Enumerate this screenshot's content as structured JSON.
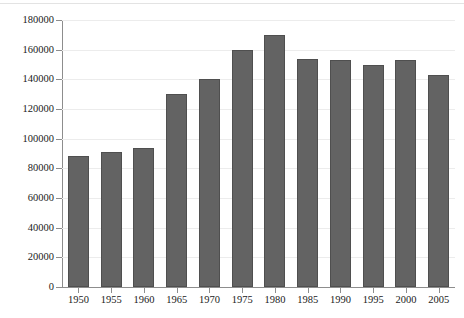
{
  "chart_data": {
    "type": "bar",
    "title": "",
    "subtitle": "",
    "xlabel": "",
    "ylabel": "",
    "categories": [
      "1950",
      "1955",
      "1960",
      "1965",
      "1970",
      "1975",
      "1980",
      "1985",
      "1990",
      "1995",
      "2000",
      "2005"
    ],
    "values": [
      88000,
      91000,
      94000,
      130000,
      140000,
      160000,
      170000,
      154000,
      153000,
      150000,
      153000,
      143000
    ],
    "series": [
      {
        "name": "",
        "values": [
          88000,
          91000,
          94000,
          130000,
          140000,
          160000,
          170000,
          154000,
          153000,
          150000,
          153000,
          143000
        ]
      }
    ],
    "ylim": [
      0,
      180000
    ],
    "ytick_labels": [
      "0",
      "20000",
      "40000",
      "60000",
      "80000",
      "100000",
      "120000",
      "140000",
      "160000",
      "180000"
    ],
    "ytick_values": [
      0,
      20000,
      40000,
      60000,
      80000,
      100000,
      120000,
      140000,
      160000,
      180000
    ],
    "xtick_labels": [
      "1950",
      "1955",
      "1960",
      "1965",
      "1970",
      "1975",
      "1980",
      "1985",
      "1990",
      "1995",
      "2000",
      "2005"
    ],
    "grid": true,
    "grid_axis": "y",
    "legend": false,
    "legend_position": "none",
    "annotations": [],
    "bar_color": "#636363",
    "bar_edge_color": "#4f4f4f",
    "gridline_color": "#ececec",
    "axis_color": "#8d8d8d",
    "text_color": "#1a1a1a",
    "background_color": "#ffffff"
  }
}
